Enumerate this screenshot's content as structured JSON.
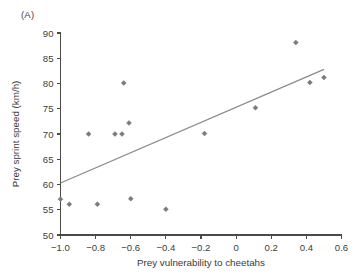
{
  "figure": {
    "panel_label": "(A)"
  },
  "chart_data": {
    "type": "scatter",
    "title": "",
    "subtitle": "",
    "xlabel": "Prey vulnerability to cheetahs",
    "ylabel": "Prey sprint speed (km/h)",
    "xlim": [
      -1.0,
      0.6
    ],
    "ylim": [
      50,
      90
    ],
    "xticks": [
      -1.0,
      -0.8,
      -0.6,
      -0.4,
      -0.2,
      0,
      0.2,
      0.4,
      0.6
    ],
    "xtick_labels": [
      "−1.0",
      "−0.8",
      "−0.6",
      "−0.4",
      "−0.2",
      "0",
      "0.2",
      "0.4",
      "0.6"
    ],
    "yticks": [
      50,
      55,
      60,
      65,
      70,
      75,
      80,
      85,
      90
    ],
    "ytick_labels": [
      "50",
      "55",
      "60",
      "65",
      "70",
      "75",
      "80",
      "85",
      "90"
    ],
    "grid": false,
    "legend": null,
    "legend_position": "none",
    "marker_color": "#7b7b7b",
    "marker_shape": "diamond",
    "points": [
      {
        "x": -1.0,
        "y": 57.1
      },
      {
        "x": -0.95,
        "y": 56.1
      },
      {
        "x": -0.84,
        "y": 70.0
      },
      {
        "x": -0.79,
        "y": 56.1
      },
      {
        "x": -0.69,
        "y": 70.0
      },
      {
        "x": -0.65,
        "y": 70.0
      },
      {
        "x": -0.64,
        "y": 80.1
      },
      {
        "x": -0.61,
        "y": 72.2
      },
      {
        "x": -0.6,
        "y": 57.2
      },
      {
        "x": -0.4,
        "y": 55.1
      },
      {
        "x": -0.18,
        "y": 70.1
      },
      {
        "x": 0.11,
        "y": 75.2
      },
      {
        "x": 0.34,
        "y": 88.1
      },
      {
        "x": 0.42,
        "y": 80.2
      },
      {
        "x": 0.5,
        "y": 81.2
      }
    ],
    "trend_line": {
      "type": "linear-fit",
      "color": "#8a8a8a",
      "x_start": -1.0,
      "y_start": 60.3,
      "x_end": 0.5,
      "y_end": 82.8
    }
  }
}
